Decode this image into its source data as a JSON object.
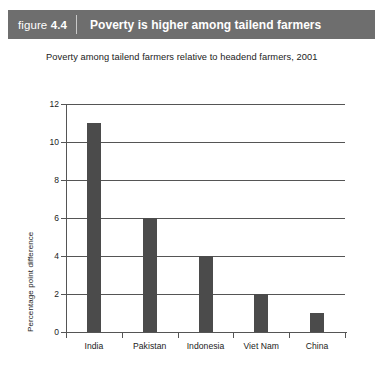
{
  "figure": {
    "number_word": "figure",
    "number_value": "4.4",
    "title": "Poverty is higher among tailend farmers",
    "header_bg": "#6e6e6e",
    "header_text_color": "#ffffff"
  },
  "chart_data": {
    "type": "bar",
    "title": "Poverty among tailend farmers relative to headend farmers, 2001",
    "categories": [
      "India",
      "Pakistan",
      "Indonesia",
      "Viet Nam",
      "China"
    ],
    "values": [
      11,
      6,
      4,
      2,
      1
    ],
    "xlabel": "",
    "ylabel": "Percentage point difference",
    "ylim": [
      0,
      12
    ],
    "yticks": [
      0,
      2,
      4,
      6,
      8,
      10,
      12
    ],
    "ytick_labels": [
      "0",
      "2",
      "4",
      "6",
      "8",
      "10",
      "12"
    ],
    "grid": true,
    "legend": false,
    "bar_color": "#4b4b4b",
    "axis_color": "#555555"
  }
}
